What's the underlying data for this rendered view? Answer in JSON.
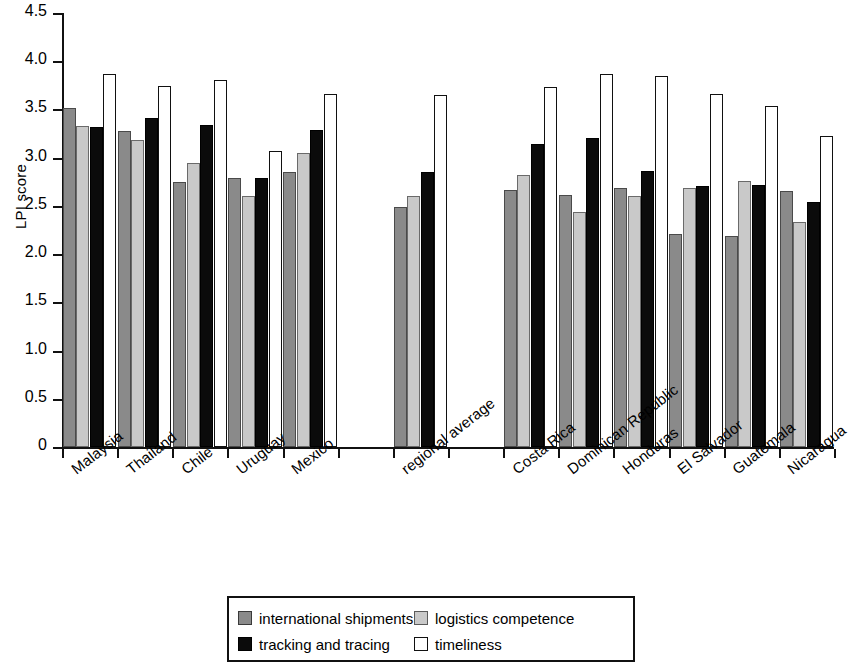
{
  "chart_data": {
    "type": "bar",
    "title": "",
    "xlabel": "",
    "ylabel": "LPI score",
    "ylim": [
      0,
      4.5
    ],
    "ytick_labels": [
      "0",
      "0.5",
      "1.0",
      "1.5",
      "2.0",
      "2.5",
      "3.0",
      "3.5",
      "4.0",
      "4.5"
    ],
    "ytick_values": [
      0,
      0.5,
      1.0,
      1.5,
      2.0,
      2.5,
      3.0,
      3.5,
      4.0,
      4.5
    ],
    "grid": false,
    "legend_position": "bottom",
    "categories": [
      "Malaysia",
      "Thailand",
      "Chile",
      "Uruguay",
      "Mexico",
      "regional average",
      "Costa Rica",
      "Dominican Republic",
      "Honduras",
      "El Salvador",
      "Guatemala",
      "Nicaragua"
    ],
    "series": [
      {
        "name": "international shipments",
        "color": "#8a8a8a",
        "values": [
          3.51,
          3.28,
          2.75,
          2.79,
          2.85,
          2.49,
          2.66,
          2.61,
          2.69,
          2.21,
          2.19,
          2.65
        ]
      },
      {
        "name": "logistics competence",
        "color": "#c9c9c9",
        "values": [
          3.33,
          3.18,
          2.94,
          2.6,
          3.05,
          2.6,
          2.82,
          2.44,
          2.6,
          2.69,
          2.76,
          2.33
        ]
      },
      {
        "name": "tracking and tracing",
        "color": "#0b0b0b",
        "values": [
          3.32,
          3.41,
          3.34,
          2.79,
          3.29,
          2.85,
          3.14,
          3.2,
          2.86,
          2.71,
          2.72,
          2.54
        ]
      },
      {
        "name": "timeliness",
        "color": "#ffffff",
        "values": [
          3.87,
          3.74,
          3.81,
          3.07,
          3.66,
          3.65,
          3.73,
          3.87,
          3.85,
          3.66,
          3.54,
          3.23
        ]
      }
    ]
  },
  "legend": {
    "items": [
      {
        "label": "international shipments",
        "swatch": "s0"
      },
      {
        "label": "logistics competence",
        "swatch": "s1"
      },
      {
        "label": "tracking and tracing",
        "swatch": "s2"
      },
      {
        "label": "timeliness",
        "swatch": "s3"
      }
    ]
  }
}
